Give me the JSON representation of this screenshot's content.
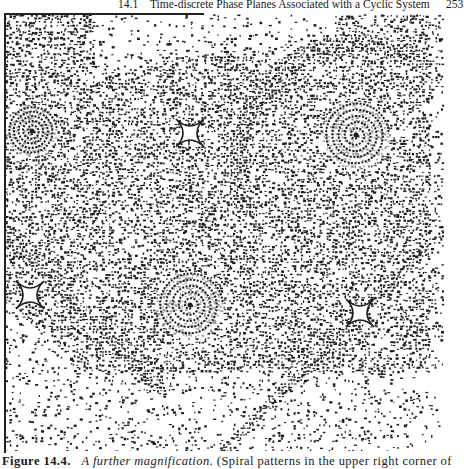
{
  "header": {
    "section_number": "14.1",
    "running_title": "Time-discrete Phase Planes Associated with a Cyclic System",
    "page_number": "253"
  },
  "figure": {
    "ink_color": "#1e1e1e",
    "paper_color": "#ffffff",
    "spirals": [
      {
        "x": 28,
        "y": 118,
        "size": "small"
      },
      {
        "x": 352,
        "y": 122,
        "size": "medium"
      },
      {
        "x": 186,
        "y": 292,
        "size": "medium"
      }
    ],
    "saddles": [
      {
        "x": 186,
        "y": 120
      },
      {
        "x": 26,
        "y": 282
      },
      {
        "x": 356,
        "y": 300
      }
    ]
  },
  "caption": {
    "label": "Figure 14.4.",
    "italic_text": "A further magnification.",
    "text": "(Spiral patterns in the upper right corner of"
  }
}
